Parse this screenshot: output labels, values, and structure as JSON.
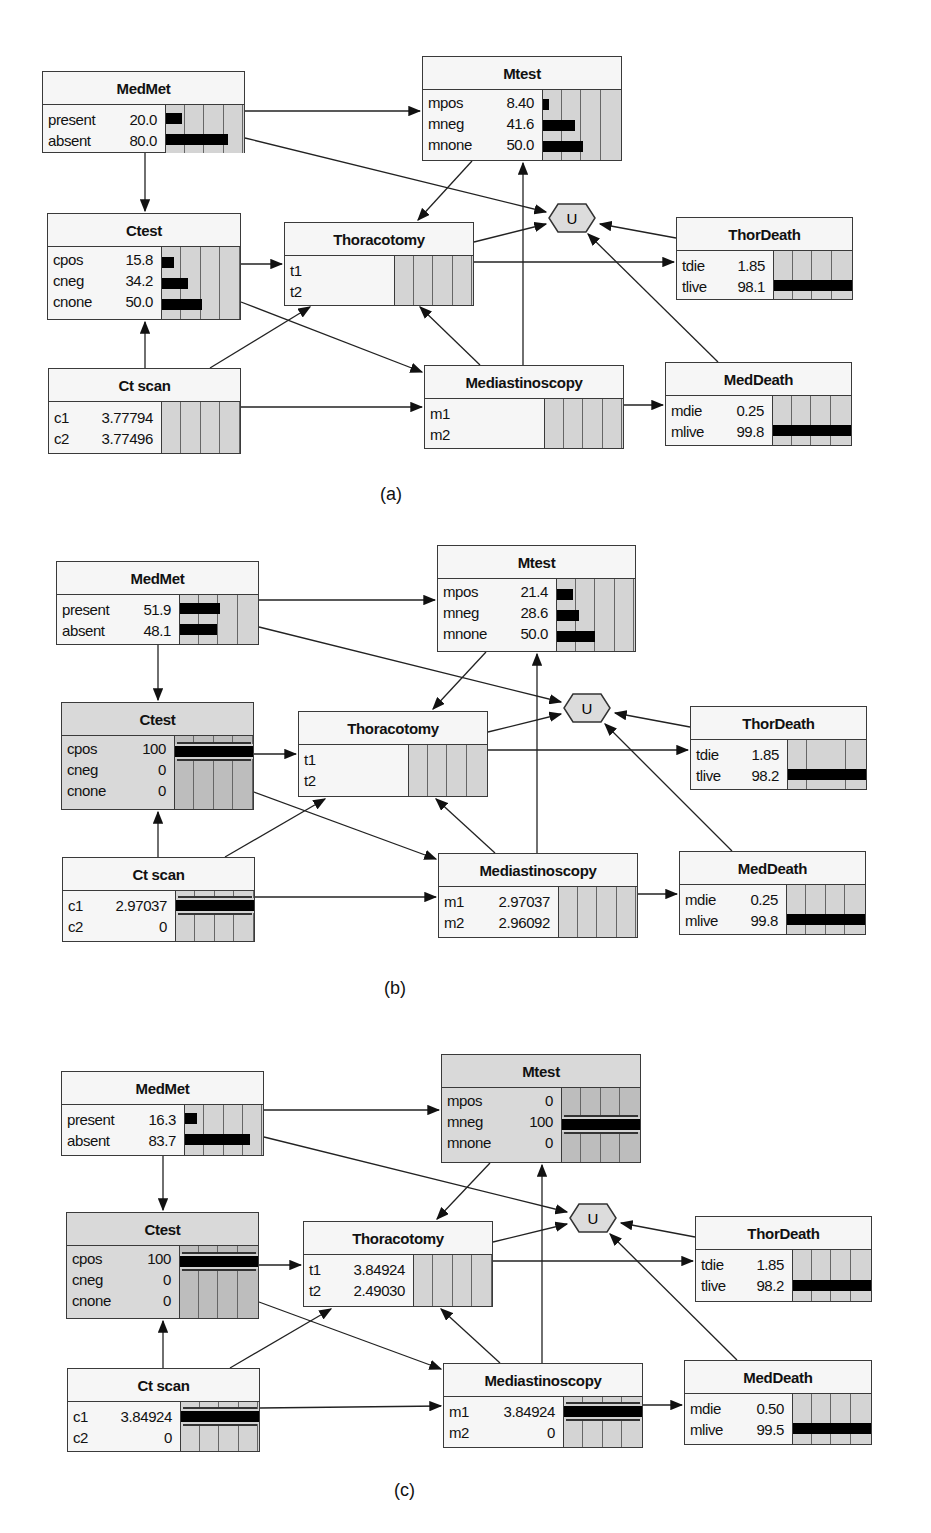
{
  "panels": [
    {
      "label": "(a)",
      "nodes": {
        "medmet": {
          "title": "MedMet",
          "states": [
            {
              "name": "present",
              "value": "20.0",
              "pct": 20
            },
            {
              "name": "absent",
              "value": "80.0",
              "pct": 80
            }
          ]
        },
        "mtest": {
          "title": "Mtest",
          "states": [
            {
              "name": "mpos",
              "value": "8.40",
              "pct": 8.4
            },
            {
              "name": "mneg",
              "value": "41.6",
              "pct": 41.6
            },
            {
              "name": "mnone",
              "value": "50.0",
              "pct": 50
            }
          ]
        },
        "ctest": {
          "title": "Ctest",
          "states": [
            {
              "name": "cpos",
              "value": "15.8",
              "pct": 15.8
            },
            {
              "name": "cneg",
              "value": "34.2",
              "pct": 34.2
            },
            {
              "name": "cnone",
              "value": "50.0",
              "pct": 50
            }
          ]
        },
        "thoracotomy": {
          "title": "Thoracotomy",
          "states": [
            {
              "name": "t1",
              "value": "",
              "pct": 0
            },
            {
              "name": "t2",
              "value": "",
              "pct": 0
            }
          ]
        },
        "thordeath": {
          "title": "ThorDeath",
          "states": [
            {
              "name": "tdie",
              "value": "1.85",
              "pct": 1.85
            },
            {
              "name": "tlive",
              "value": "98.1",
              "pct": 98.1
            }
          ]
        },
        "ctscan": {
          "title": "Ct scan",
          "states": [
            {
              "name": "c1",
              "value": "3.77794",
              "pct": 0
            },
            {
              "name": "c2",
              "value": "3.77496",
              "pct": 0
            }
          ]
        },
        "mediastinoscopy": {
          "title": "Mediastinoscopy",
          "states": [
            {
              "name": "m1",
              "value": "",
              "pct": 0
            },
            {
              "name": "m2",
              "value": "",
              "pct": 0
            }
          ]
        },
        "meddeath": {
          "title": "MedDeath",
          "states": [
            {
              "name": "mdie",
              "value": "0.25",
              "pct": 0.25
            },
            {
              "name": "mlive",
              "value": "99.8",
              "pct": 99.8
            }
          ]
        },
        "utility": {
          "title": "U"
        }
      }
    },
    {
      "label": "(b)",
      "nodes": {
        "medmet": {
          "title": "MedMet",
          "states": [
            {
              "name": "present",
              "value": "51.9",
              "pct": 51.9
            },
            {
              "name": "absent",
              "value": "48.1",
              "pct": 48.1
            }
          ]
        },
        "mtest": {
          "title": "Mtest",
          "states": [
            {
              "name": "mpos",
              "value": "21.4",
              "pct": 21.4
            },
            {
              "name": "mneg",
              "value": "28.6",
              "pct": 28.6
            },
            {
              "name": "mnone",
              "value": "50.0",
              "pct": 50
            }
          ]
        },
        "ctest": {
          "title": "Ctest",
          "evidence": true,
          "states": [
            {
              "name": "cpos",
              "value": "100",
              "pct": 100
            },
            {
              "name": "cneg",
              "value": "0",
              "pct": 0
            },
            {
              "name": "cnone",
              "value": "0",
              "pct": 0
            }
          ]
        },
        "thoracotomy": {
          "title": "Thoracotomy",
          "states": [
            {
              "name": "t1",
              "value": "",
              "pct": 0
            },
            {
              "name": "t2",
              "value": "",
              "pct": 0
            }
          ]
        },
        "thordeath": {
          "title": "ThorDeath",
          "states": [
            {
              "name": "tdie",
              "value": "1.85",
              "pct": 1.85
            },
            {
              "name": "tlive",
              "value": "98.2",
              "pct": 98.2
            }
          ]
        },
        "ctscan": {
          "title": "Ct scan",
          "decided": 0,
          "states": [
            {
              "name": "c1",
              "value": "2.97037",
              "pct": 100
            },
            {
              "name": "c2",
              "value": "0",
              "pct": 0
            }
          ]
        },
        "mediastinoscopy": {
          "title": "Mediastinoscopy",
          "states": [
            {
              "name": "m1",
              "value": "2.97037",
              "pct": 0
            },
            {
              "name": "m2",
              "value": "2.96092",
              "pct": 0
            }
          ]
        },
        "meddeath": {
          "title": "MedDeath",
          "states": [
            {
              "name": "mdie",
              "value": "0.25",
              "pct": 0.25
            },
            {
              "name": "mlive",
              "value": "99.8",
              "pct": 99.8
            }
          ]
        },
        "utility": {
          "title": "U"
        }
      }
    },
    {
      "label": "(c)",
      "nodes": {
        "medmet": {
          "title": "MedMet",
          "states": [
            {
              "name": "present",
              "value": "16.3",
              "pct": 16.3
            },
            {
              "name": "absent",
              "value": "83.7",
              "pct": 83.7
            }
          ]
        },
        "mtest": {
          "title": "Mtest",
          "evidence": true,
          "states": [
            {
              "name": "mpos",
              "value": "0",
              "pct": 0
            },
            {
              "name": "mneg",
              "value": "100",
              "pct": 100
            },
            {
              "name": "mnone",
              "value": "0",
              "pct": 0
            }
          ]
        },
        "ctest": {
          "title": "Ctest",
          "evidence": true,
          "states": [
            {
              "name": "cpos",
              "value": "100",
              "pct": 100
            },
            {
              "name": "cneg",
              "value": "0",
              "pct": 0
            },
            {
              "name": "cnone",
              "value": "0",
              "pct": 0
            }
          ]
        },
        "thoracotomy": {
          "title": "Thoracotomy",
          "states": [
            {
              "name": "t1",
              "value": "3.84924",
              "pct": 0
            },
            {
              "name": "t2",
              "value": "2.49030",
              "pct": 0
            }
          ]
        },
        "thordeath": {
          "title": "ThorDeath",
          "states": [
            {
              "name": "tdie",
              "value": "1.85",
              "pct": 1.85
            },
            {
              "name": "tlive",
              "value": "98.2",
              "pct": 98.2
            }
          ]
        },
        "ctscan": {
          "title": "Ct scan",
          "states": [
            {
              "name": "c1",
              "value": "3.84924",
              "pct": 100
            },
            {
              "name": "c2",
              "value": "0",
              "pct": 0
            }
          ]
        },
        "mediastinoscopy": {
          "title": "Mediastinoscopy",
          "states": [
            {
              "name": "m1",
              "value": "3.84924",
              "pct": 100
            },
            {
              "name": "m2",
              "value": "0",
              "pct": 0
            }
          ]
        },
        "meddeath": {
          "title": "MedDeath",
          "states": [
            {
              "name": "mdie",
              "value": "0.50",
              "pct": 0.5
            },
            {
              "name": "mlive",
              "value": "99.5",
              "pct": 99.5
            }
          ]
        },
        "utility": {
          "title": "U"
        }
      }
    }
  ],
  "edges": [
    [
      "medmet",
      "mtest"
    ],
    [
      "medmet",
      "ctest"
    ],
    [
      "medmet",
      "utility"
    ],
    [
      "mtest",
      "thoracotomy"
    ],
    [
      "ctest",
      "thoracotomy"
    ],
    [
      "ctest",
      "mediastinoscopy"
    ],
    [
      "ctscan",
      "ctest"
    ],
    [
      "ctscan",
      "thoracotomy"
    ],
    [
      "ctscan",
      "mediastinoscopy"
    ],
    [
      "mediastinoscopy",
      "mtest"
    ],
    [
      "mediastinoscopy",
      "thoracotomy"
    ],
    [
      "mediastinoscopy",
      "meddeath"
    ],
    [
      "thoracotomy",
      "utility"
    ],
    [
      "thoracotomy",
      "thordeath"
    ],
    [
      "thordeath",
      "utility"
    ],
    [
      "meddeath",
      "utility"
    ]
  ]
}
